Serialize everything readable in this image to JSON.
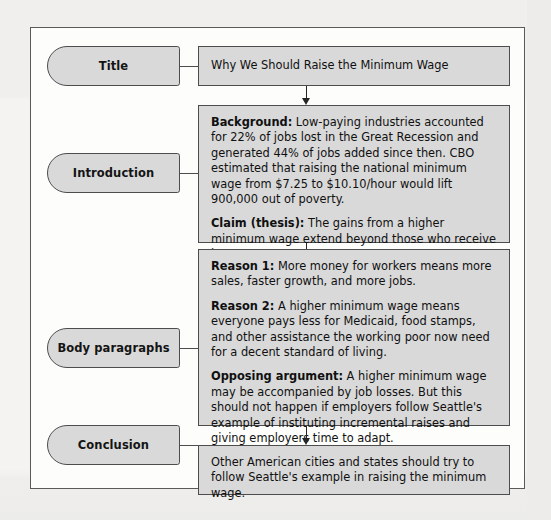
{
  "diagram": {
    "colors": {
      "box_fill": "#d9d9d9",
      "box_border": "#4d4d4d",
      "frame_border": "#595959",
      "page_background": "#f2f1ef",
      "text": "#101010"
    },
    "rows": [
      {
        "id": "title",
        "label": "Title",
        "content_blocks": [
          {
            "lead": "",
            "text": "Why We Should Raise the Minimum Wage"
          }
        ]
      },
      {
        "id": "introduction",
        "label": "Introduction",
        "content_blocks": [
          {
            "lead": "Background:",
            "text": " Low-paying industries accounted for 22% of jobs lost in the Great Recession and generated 44% of jobs added since then. CBO estimated that raising the national minimum wage from $7.25 to $10.10/hour would lift 900,000 out of poverty."
          },
          {
            "lead": "Claim (thesis):",
            "text": " The gains from a higher minimum wage extend beyond those who receive it."
          }
        ]
      },
      {
        "id": "body-paragraphs",
        "label": "Body paragraphs",
        "content_blocks": [
          {
            "lead": "Reason 1:",
            "text": " More money for workers means more sales, faster growth, and more jobs."
          },
          {
            "lead": "Reason 2:",
            "text": " A higher minimum wage means everyone pays less for Medicaid, food stamps, and other assistance the working poor now need for a decent standard of living."
          },
          {
            "lead": "Opposing argument:",
            "text": " A higher minimum wage may be accompanied by job losses. But this should not happen if employers follow Seattle's example of instituting incremental raises and giving employers time to adapt."
          }
        ]
      },
      {
        "id": "conclusion",
        "label": "Conclusion",
        "content_blocks": [
          {
            "lead": "",
            "text": "Other American cities and states should try to follow Seattle's example in raising the minimum wage."
          }
        ]
      }
    ],
    "connectors": {
      "arrow_down_icon": "arrow-down-icon",
      "count": 3
    }
  }
}
